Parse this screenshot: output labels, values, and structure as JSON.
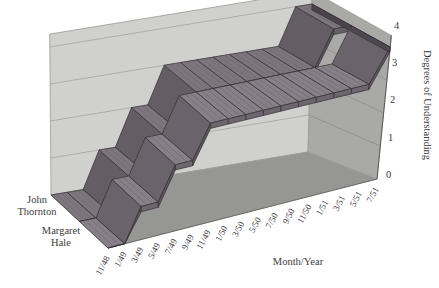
{
  "figure": {
    "background": "#ffffff"
  },
  "chart_data": {
    "type": "area",
    "subtype": "3d-step-ribbon",
    "title": "",
    "xlabel": "Month/Year",
    "ylabel": "Degrees of Understanding",
    "categories": [
      "11/48",
      "1/49",
      "3/49",
      "5/49",
      "7/49",
      "9/49",
      "11/49",
      "1/50",
      "3/50",
      "5/50",
      "7/50",
      "9/50",
      "11/50",
      "1/51",
      "3/51",
      "5/51",
      "7/51"
    ],
    "y_ticks": [
      "0",
      "1",
      "2",
      "3",
      "4"
    ],
    "ylim": [
      0,
      4
    ],
    "grid": true,
    "legend_position": "left-of-series-rows",
    "series": [
      {
        "name": "John Thornton",
        "name_lines": [
          "John",
          "Thornton"
        ],
        "values": [
          0,
          0,
          0,
          1,
          1,
          2,
          2,
          3,
          3,
          3,
          3,
          3,
          3,
          3,
          3,
          4,
          4
        ],
        "colors": {
          "top": "#7e767d",
          "front": "#665f66",
          "riserTop": "#655d64",
          "riserFront": "#595259",
          "cap": "#49434a"
        }
      },
      {
        "name": "Margaret Hale",
        "name_lines": [
          "Margaret",
          "Hale"
        ],
        "values": [
          0,
          0,
          1,
          1,
          2,
          2,
          3,
          3,
          3,
          3,
          3,
          3,
          3,
          3,
          3,
          3,
          4
        ],
        "colors": {
          "top": "#878089",
          "front": "#6e666e",
          "riserTop": "#6b636b",
          "riserFront": "#5e5760",
          "cap": "#4d474f"
        }
      }
    ],
    "walls": {
      "back": "#d0d0ce",
      "right": "#a9a9a7",
      "floor": "#969694",
      "gridline_back": "#a3a3a1",
      "gridline_right": "#8c8c8a",
      "edge": "#9a9a98",
      "axis_edge": "#5a5a58"
    },
    "ribbon_outline": "#332e34",
    "hatch_color": "#6d656c",
    "text_color": "#3b3b3b"
  }
}
